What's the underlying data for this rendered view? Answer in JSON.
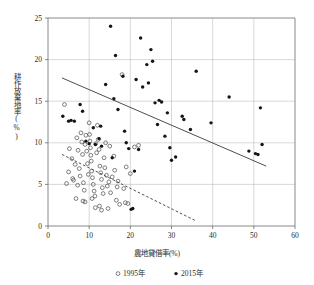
{
  "chart_data": {
    "type": "scatter",
    "title": "",
    "xlabel": "農地貸借率(%)",
    "ylabel": "耕作放棄地率(%)",
    "xlim": [
      0,
      60
    ],
    "ylim": [
      0,
      25
    ],
    "xticks": [
      "0",
      "10",
      "20",
      "30",
      "40",
      "50",
      "60"
    ],
    "yticks": [
      "0",
      "5",
      "10",
      "15",
      "20",
      "25"
    ],
    "xtick_values": [
      0,
      10,
      20,
      30,
      40,
      50,
      60
    ],
    "ytick_values": [
      0,
      5,
      10,
      15,
      20,
      25
    ],
    "grid": true,
    "legend_position": "bottom",
    "series": [
      {
        "name": "1995年",
        "marker": "open-circle",
        "color": "#4a4a4a",
        "points": [
          [
            4.0,
            14.6
          ],
          [
            5.2,
            9.3
          ],
          [
            5.8,
            8.1
          ],
          [
            6.0,
            5.7
          ],
          [
            6.2,
            5.5
          ],
          [
            6.6,
            7.4
          ],
          [
            7.0,
            10.6
          ],
          [
            7.3,
            9.1
          ],
          [
            7.6,
            6.9
          ],
          [
            7.8,
            6.0
          ],
          [
            8.0,
            11.2
          ],
          [
            8.2,
            10.1
          ],
          [
            8.4,
            8.6
          ],
          [
            8.6,
            5.2
          ],
          [
            8.8,
            4.3
          ],
          [
            9.0,
            9.8
          ],
          [
            9.2,
            10.9
          ],
          [
            9.4,
            9.0
          ],
          [
            9.6,
            7.5
          ],
          [
            9.8,
            6.2
          ],
          [
            10.0,
            12.4
          ],
          [
            10.1,
            11.0
          ],
          [
            10.2,
            10.2
          ],
          [
            10.3,
            9.4
          ],
          [
            10.4,
            8.5
          ],
          [
            10.5,
            7.8
          ],
          [
            10.6,
            6.6
          ],
          [
            10.8,
            5.8
          ],
          [
            11.0,
            5.0
          ],
          [
            11.2,
            4.2
          ],
          [
            11.4,
            3.6
          ],
          [
            11.6,
            9.9
          ],
          [
            11.8,
            8.8
          ],
          [
            12.0,
            12.1
          ],
          [
            12.2,
            10.4
          ],
          [
            12.4,
            9.2
          ],
          [
            12.6,
            7.2
          ],
          [
            12.8,
            6.4
          ],
          [
            13.0,
            5.6
          ],
          [
            13.2,
            4.6
          ],
          [
            13.4,
            3.9
          ],
          [
            13.6,
            8.2
          ],
          [
            13.8,
            7.0
          ],
          [
            14.0,
            10.0
          ],
          [
            14.2,
            6.1
          ],
          [
            14.4,
            4.8
          ],
          [
            14.8,
            5.3
          ],
          [
            15.0,
            9.6
          ],
          [
            15.2,
            4.0
          ],
          [
            15.6,
            5.9
          ],
          [
            16.0,
            8.4
          ],
          [
            16.2,
            6.7
          ],
          [
            16.6,
            3.1
          ],
          [
            17.0,
            5.4
          ],
          [
            17.4,
            2.6
          ],
          [
            18.0,
            18.2
          ],
          [
            18.4,
            4.5
          ],
          [
            18.8,
            2.8
          ],
          [
            19.0,
            7.1
          ],
          [
            19.4,
            2.7
          ],
          [
            20.0,
            6.3
          ],
          [
            21.0,
            9.5
          ],
          [
            22.0,
            9.7
          ],
          [
            9.0,
            2.9
          ],
          [
            11.5,
            2.2
          ],
          [
            13.0,
            1.9
          ],
          [
            6.8,
            3.3
          ],
          [
            8.5,
            3.0
          ],
          [
            12.5,
            2.4
          ],
          [
            5.0,
            6.5
          ],
          [
            7.2,
            4.9
          ],
          [
            10.7,
            3.3
          ],
          [
            14.6,
            2.1
          ],
          [
            4.5,
            5.1
          ],
          [
            16.8,
            4.7
          ]
        ]
      },
      {
        "name": "2015年",
        "marker": "filled-circle",
        "color": "#151515",
        "points": [
          [
            3.6,
            13.2
          ],
          [
            5.0,
            12.6
          ],
          [
            5.6,
            12.7
          ],
          [
            7.8,
            14.6
          ],
          [
            8.4,
            13.8
          ],
          [
            9.2,
            10.2
          ],
          [
            10.0,
            9.9
          ],
          [
            11.0,
            11.8
          ],
          [
            11.5,
            9.8
          ],
          [
            12.4,
            10.5
          ],
          [
            13.0,
            9.6
          ],
          [
            14.0,
            17.0
          ],
          [
            15.2,
            24.0
          ],
          [
            15.6,
            8.2
          ],
          [
            16.0,
            15.3
          ],
          [
            16.4,
            20.5
          ],
          [
            17.0,
            14.0
          ],
          [
            18.2,
            18.0
          ],
          [
            18.6,
            11.4
          ],
          [
            19.0,
            10.0
          ],
          [
            19.6,
            9.3
          ],
          [
            20.2,
            2.0
          ],
          [
            20.6,
            2.1
          ],
          [
            21.0,
            6.6
          ],
          [
            21.4,
            17.6
          ],
          [
            22.0,
            9.2
          ],
          [
            22.5,
            22.6
          ],
          [
            23.0,
            16.7
          ],
          [
            24.0,
            19.4
          ],
          [
            24.4,
            17.2
          ],
          [
            25.0,
            21.2
          ],
          [
            25.4,
            19.8
          ],
          [
            26.0,
            14.8
          ],
          [
            26.6,
            12.2
          ],
          [
            27.0,
            15.1
          ],
          [
            27.6,
            14.9
          ],
          [
            28.4,
            10.8
          ],
          [
            29.0,
            13.6
          ],
          [
            30.0,
            7.9
          ],
          [
            31.0,
            8.3
          ],
          [
            32.6,
            13.2
          ],
          [
            33.0,
            12.8
          ],
          [
            34.6,
            11.6
          ],
          [
            36.0,
            18.6
          ],
          [
            39.6,
            12.4
          ],
          [
            44.0,
            15.5
          ],
          [
            48.8,
            9.0
          ],
          [
            50.4,
            8.7
          ],
          [
            51.0,
            8.6
          ],
          [
            51.6,
            14.2
          ],
          [
            52.0,
            9.8
          ],
          [
            29.6,
            9.4
          ],
          [
            12.8,
            12.0
          ],
          [
            6.4,
            12.6
          ]
        ]
      }
    ],
    "trend_lines": [
      {
        "name": "2015-trend",
        "style": "solid",
        "x0": 3.4,
        "y0": 17.8,
        "x1": 53.0,
        "y1": 7.2
      },
      {
        "name": "1995-trend",
        "style": "dashed",
        "x0": 3.4,
        "y0": 8.6,
        "x1": 36.0,
        "y1": 0.6
      }
    ]
  },
  "legend": {
    "items": [
      {
        "label": "1995年",
        "marker": "open-circle"
      },
      {
        "label": "2015年",
        "marker": "filled-circle"
      }
    ]
  }
}
